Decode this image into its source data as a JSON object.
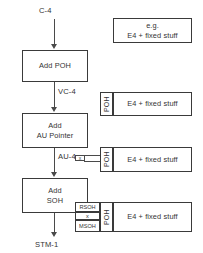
{
  "diagram": {
    "flow": {
      "start_label": "C-4",
      "end_label": "STM-1",
      "steps": [
        {
          "id": "add-poh",
          "lines": [
            "Add POH"
          ]
        },
        {
          "id": "add-au-pointer",
          "lines": [
            "Add",
            "AU Pointer"
          ]
        },
        {
          "id": "add-soh",
          "lines": [
            "Add",
            "SOH"
          ]
        }
      ],
      "intermediate_labels": [
        {
          "id": "vc-4",
          "text": "VC-4"
        },
        {
          "id": "au-4",
          "text": "AU-4"
        }
      ]
    },
    "frames": [
      {
        "id": "frame-c4",
        "payload_lines": [
          "e.g.",
          "E4 + fixed stuff"
        ],
        "cells": []
      },
      {
        "id": "frame-vc4",
        "payload_lines": [
          "E4 + fixed stuff"
        ],
        "cells": [
          {
            "id": "poh",
            "label": "POH"
          }
        ]
      },
      {
        "id": "frame-au4",
        "payload_lines": [
          "E4 + fixed stuff"
        ],
        "cells": [
          {
            "id": "poh",
            "label": "POH"
          }
        ],
        "branch": {
          "id": "au-pointer-callout",
          "label": "x"
        }
      },
      {
        "id": "frame-stm1",
        "payload_lines": [
          "E4 + fixed stuff"
        ],
        "cells": [
          {
            "id": "poh",
            "label": "POH"
          }
        ],
        "overhead_stack": [
          {
            "id": "rsoh",
            "label": "RSOH"
          },
          {
            "id": "au-pointer",
            "label": "x"
          },
          {
            "id": "msoh",
            "label": "MSOH"
          }
        ]
      }
    ],
    "colors": {
      "stroke": "#3a3a3a",
      "line": "#4a4a4a",
      "text": "#333333",
      "background": "#ffffff"
    }
  }
}
